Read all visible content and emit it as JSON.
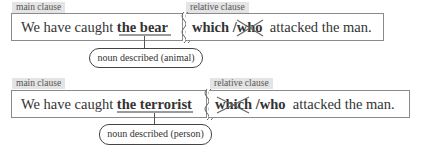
{
  "examples": [
    {
      "main_label": "main clause",
      "relative_label": "relative clause",
      "main_plain": "We have caught ",
      "main_noun": "the bear",
      "rel_first": "which",
      "rel_sep": " /",
      "rel_second": "who",
      "rel_rest": "attacked the man.",
      "crossed_out": "who",
      "callout": "noun described (animal)"
    },
    {
      "main_label": "main clause",
      "relative_label": "relative clause",
      "main_plain": "We have caught ",
      "main_noun": "the terrorist",
      "rel_first": "which",
      "rel_sep": " /",
      "rel_second": "who",
      "rel_rest": "attacked the man.",
      "crossed_out": "which",
      "callout": "noun described (person)"
    }
  ],
  "colors": {
    "tab_bg": "#e4e4e4",
    "box_border": "#8a8a8a",
    "underline": "#9a9a9a",
    "strike": "#666666"
  }
}
